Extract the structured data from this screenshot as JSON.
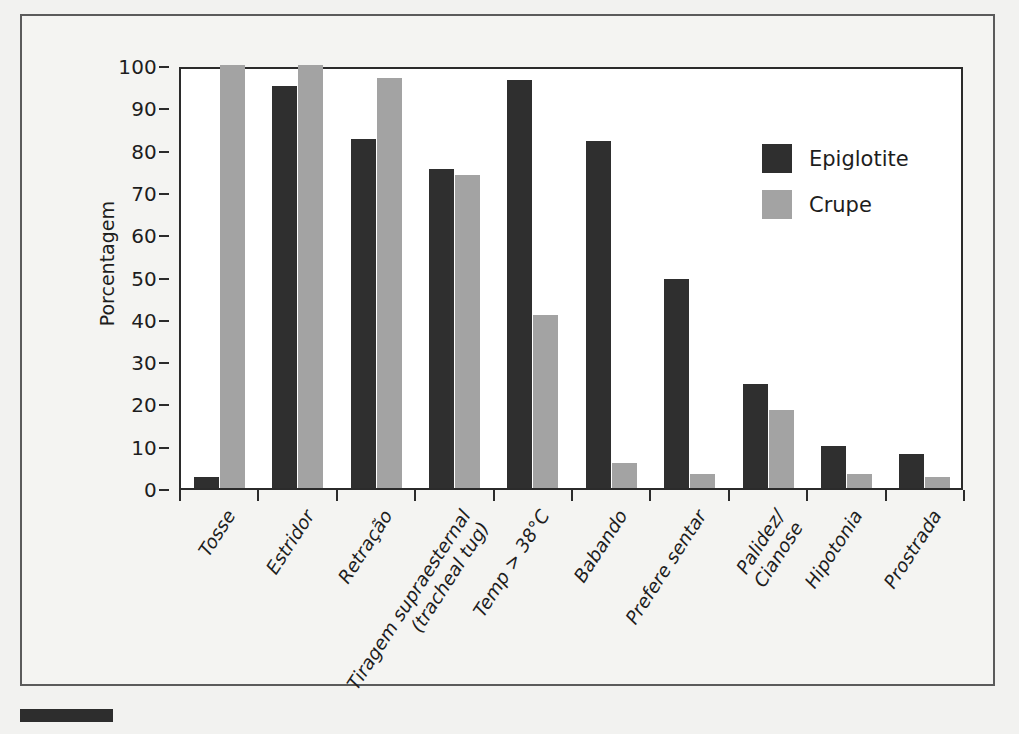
{
  "chart_data": {
    "type": "bar",
    "title": "",
    "xlabel": "",
    "ylabel": "Porcentagem",
    "ylim": [
      0,
      100
    ],
    "yticks": [
      0,
      10,
      20,
      30,
      40,
      50,
      60,
      70,
      80,
      90,
      100
    ],
    "grid": false,
    "legend_position": "top-right",
    "categories": [
      "Tosse",
      "Estridor",
      "Retração",
      "Tiragem supraesternal (tracheal tug)",
      "Temp > 38°C",
      "Babando",
      "Prefere sentar",
      "Palidez/Cianose",
      "Hipotonia",
      "Prostrada"
    ],
    "category_lines": [
      [
        "Tosse"
      ],
      [
        "Estridor"
      ],
      [
        "Retração"
      ],
      [
        "Tiragem supraesternal",
        "(tracheal tug)"
      ],
      [
        "Temp > 38°C"
      ],
      [
        "Babando"
      ],
      [
        "Prefere sentar"
      ],
      [
        "Palidez/",
        "Cianose"
      ],
      [
        "Hipotonia"
      ],
      [
        "Prostrada"
      ]
    ],
    "series": [
      {
        "name": "Epiglotite",
        "color": "#2f2f2f",
        "values": [
          2.5,
          95,
          82.5,
          75.5,
          96.5,
          82,
          49.5,
          24.5,
          10,
          8
        ]
      },
      {
        "name": "Crupe",
        "color": "#a3a3a3",
        "values": [
          100,
          100,
          97,
          74,
          41,
          6,
          3.2,
          18.5,
          3.2,
          2.5
        ]
      }
    ]
  },
  "legend": {
    "items": [
      {
        "label": "Epiglotite"
      },
      {
        "label": "Crupe"
      }
    ]
  }
}
